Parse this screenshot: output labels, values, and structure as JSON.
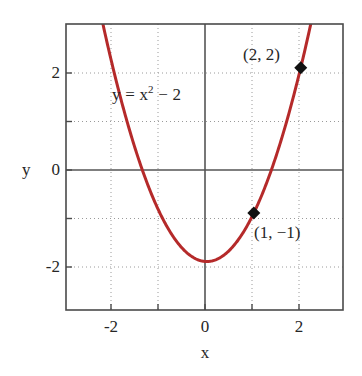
{
  "chart_data": {
    "type": "line",
    "title": "",
    "xlabel": "x",
    "ylabel": "y",
    "xlim": [
      -3.0,
      2.9
    ],
    "ylim": [
      -3.0,
      2.9
    ],
    "grid": true,
    "grid_style": "dotted",
    "legend": "none",
    "equation_label": "y = x",
    "equation_exponent": "2",
    "equation_tail": " − 2",
    "curve_color": "#b52a2a",
    "axis_color": "#555555",
    "grid_color": "#9a9a9a",
    "frame_color": "#4a4a4a",
    "marker_color": "#111111",
    "function": "y = x^2 - 2",
    "series": [
      {
        "name": "y = x^2 - 2",
        "x": [
          -3.0,
          -2.8,
          -2.6,
          -2.4,
          -2.2,
          -2.0,
          -1.8,
          -1.6,
          -1.4,
          -1.2,
          -1.0,
          -0.8,
          -0.6,
          -0.4,
          -0.2,
          0.0,
          0.2,
          0.4,
          0.6,
          0.8,
          1.0,
          1.2,
          1.4,
          1.6,
          1.8,
          2.0,
          2.2
        ],
        "y": [
          7.0,
          5.84,
          4.76,
          3.76,
          2.84,
          2.0,
          1.24,
          0.56,
          -0.04,
          -0.56,
          -1.0,
          -1.36,
          -1.64,
          -1.84,
          -1.96,
          -2.0,
          -1.96,
          -1.84,
          -1.64,
          -1.36,
          -1.0,
          -0.56,
          -0.04,
          0.56,
          1.24,
          2.0,
          2.84
        ]
      }
    ],
    "points": [
      {
        "label": "(2, 2)",
        "x": 2,
        "y": 2
      },
      {
        "label": "(1, −1)",
        "x": 1,
        "y": -1
      }
    ],
    "xticks": [
      -2,
      -1,
      0,
      1,
      2
    ],
    "xtick_labels": [
      "-2",
      "",
      "0",
      "",
      "2"
    ],
    "yticks": [
      -2,
      -1,
      0,
      1,
      2
    ],
    "ytick_labels": [
      "-2",
      "",
      "0",
      "",
      "2"
    ]
  },
  "axes": {
    "x_title": "x",
    "y_title": "y"
  },
  "ticks": {
    "x": [
      {
        "value": -2,
        "label": "-2"
      },
      {
        "value": 0,
        "label": "0"
      },
      {
        "value": 2,
        "label": "2"
      }
    ],
    "y": [
      {
        "value": 2,
        "label": "2"
      },
      {
        "value": 0,
        "label": "0"
      },
      {
        "value": -2,
        "label": "-2"
      }
    ]
  },
  "annotations": {
    "equation_prefix": "y = x",
    "equation_sup": "2",
    "equation_suffix": " − 2",
    "point_top": "(2, 2)",
    "point_bottom": "(1, −1)"
  }
}
